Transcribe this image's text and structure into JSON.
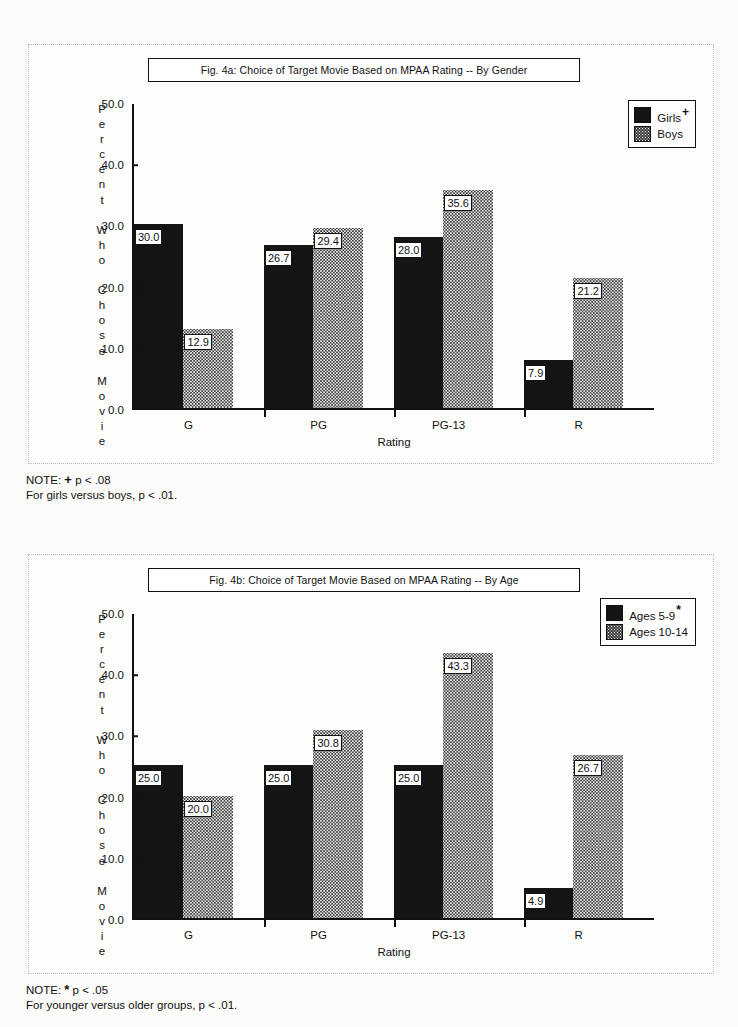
{
  "figures": [
    {
      "id": "fig-4a",
      "title": "Fig. 4a:  Choice of Target Movie Based on MPAA Rating -- By Gender",
      "legend": [
        {
          "label": "Girls",
          "marker": "+",
          "swatch": "solid-black"
        },
        {
          "label": "Boys",
          "marker": "",
          "swatch": "dotted-gray"
        }
      ],
      "note_line1_prefix": "NOTE:",
      "note_line1_symbol": "+",
      "note_line1_text": "p < .08",
      "note_line2": "For girls versus boys, p < .01.",
      "chart_data": {
        "type": "bar",
        "title": "Fig. 4a:  Choice of Target Movie Based on MPAA Rating -- By Gender",
        "categories": [
          "G",
          "PG",
          "PG-13",
          "R"
        ],
        "series": [
          {
            "name": "Girls",
            "values": [
              30.0,
              26.7,
              28.0,
              7.9
            ]
          },
          {
            "name": "Boys",
            "values": [
              12.9,
              29.4,
              35.6,
              21.2
            ]
          }
        ],
        "xlabel": "Rating",
        "ylabel": "Percent Who Chose Movie",
        "ylim": [
          0,
          50
        ],
        "yticks": [
          "0.0",
          "10.0",
          "20.0",
          "30.0",
          "40.0",
          "50.0"
        ],
        "grid": false,
        "legend_position": "top-right"
      }
    },
    {
      "id": "fig-4b",
      "title": "Fig. 4b:  Choice of Target Movie Based on MPAA Rating -- By Age",
      "legend": [
        {
          "label": "Ages  5-9",
          "marker": "*",
          "swatch": "solid-black"
        },
        {
          "label": "Ages  10-14",
          "marker": "",
          "swatch": "dotted-gray"
        }
      ],
      "note_line1_prefix": "NOTE:",
      "note_line1_symbol": "*",
      "note_line1_text": "p < .05",
      "note_line2": "For younger versus older groups, p < .01.",
      "chart_data": {
        "type": "bar",
        "title": "Fig. 4b:  Choice of Target Movie Based on MPAA Rating -- By Age",
        "categories": [
          "G",
          "PG",
          "PG-13",
          "R"
        ],
        "series": [
          {
            "name": "Ages  5-9",
            "values": [
              25.0,
              25.0,
              25.0,
              4.9
            ]
          },
          {
            "name": "Ages  10-14",
            "values": [
              20.0,
              30.8,
              43.3,
              26.7
            ]
          }
        ],
        "xlabel": "Rating",
        "ylabel": "Percent Who Chose Movie",
        "ylim": [
          0,
          50
        ],
        "yticks": [
          "0.0",
          "10.0",
          "20.0",
          "30.0",
          "40.0",
          "50.0"
        ],
        "grid": false,
        "legend_position": "top-right"
      }
    }
  ],
  "yaxis_stack": [
    "P",
    "e",
    "r",
    "c",
    "e",
    "n",
    "t",
    "",
    "W",
    "h",
    "o",
    "",
    "C",
    "h",
    "o",
    "s",
    "e",
    "",
    "M",
    "o",
    "v",
    "i",
    "e"
  ],
  "colors": {
    "series_1": "#141414",
    "series_2": "#3a3a3a",
    "axis": "#111111",
    "paper": "#fbfbf9"
  }
}
